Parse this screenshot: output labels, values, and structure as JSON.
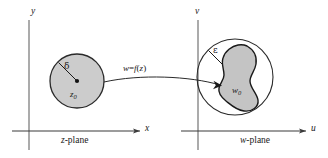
{
  "figure": {
    "background_color": "#ffffff",
    "stroke_color": "#1a1a1a",
    "fill_color": "#c9c9c9",
    "axis_color": "#555555",
    "width": 328,
    "height": 158
  },
  "left_panel": {
    "name": "z-plane",
    "caption_prefix": "z",
    "caption_suffix": "-plane",
    "vertical_axis_label": "y",
    "horizontal_axis_label": "x",
    "region": {
      "shape": "circle",
      "radius_label": "δ",
      "center_label": "z",
      "center_subscript": "0",
      "center_point": [
        77,
        81
      ],
      "radius_px": 27
    }
  },
  "right_panel": {
    "name": "w-plane",
    "caption_prefix": "w",
    "caption_suffix": "-plane",
    "vertical_axis_label": "v",
    "horizontal_axis_label": "u",
    "neighborhood": {
      "shape": "circle",
      "radius_label": "ε",
      "center_point": [
        235,
        77
      ],
      "radius_px": 38
    },
    "image_region": {
      "shape": "blob",
      "center_label": "w",
      "center_subscript": "0",
      "label_point": [
        239,
        84
      ]
    }
  },
  "mapping_arrow": {
    "label_w": "w",
    "label_equals": "=",
    "label_f": "f",
    "label_open": "(",
    "label_z": "z",
    "label_close": ")",
    "label_full": "w = f(z)",
    "from_point": [
      104,
      81
    ],
    "to_point": [
      222,
      85
    ]
  }
}
